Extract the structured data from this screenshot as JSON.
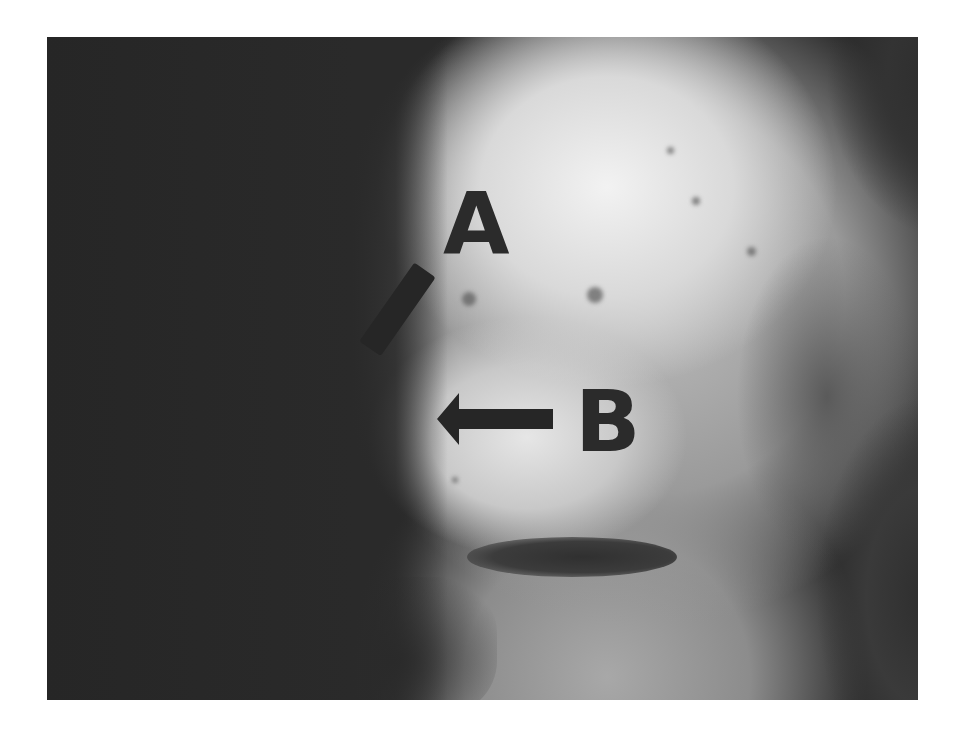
{
  "figure": {
    "type": "clinical-photograph",
    "color_mode": "grayscale",
    "labels": [
      {
        "id": "A",
        "text": "A",
        "pointer": "diagonal bar pointing down-left"
      },
      {
        "id": "B",
        "text": "B",
        "pointer": "left arrow"
      }
    ]
  },
  "colors": {
    "background": "#ffffff",
    "dark_area": "#2a2a2a",
    "label_color": "#2b2b2b"
  }
}
